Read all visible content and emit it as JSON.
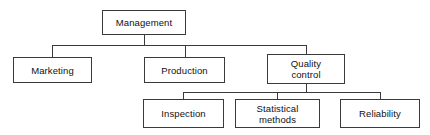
{
  "diagram": {
    "background_color": "#ffffff",
    "border_color": "#3a3a3a",
    "text_color": "#111111",
    "nodes": [
      {
        "id": "management",
        "label": "Management",
        "level": 0,
        "x": 102,
        "y": 10,
        "w": 84,
        "h": 25
      },
      {
        "id": "marketing",
        "label": "Marketing",
        "level": 1,
        "x": 13,
        "y": 57,
        "w": 79,
        "h": 26
      },
      {
        "id": "production",
        "label": "Production",
        "level": 1,
        "x": 144,
        "y": 57,
        "w": 81,
        "h": 26
      },
      {
        "id": "quality-control",
        "label": "Quality\ncontrol",
        "level": 1,
        "x": 267,
        "y": 54,
        "w": 78,
        "h": 30
      },
      {
        "id": "inspection",
        "label": "Inspection",
        "level": 2,
        "x": 143,
        "y": 99,
        "w": 81,
        "h": 29
      },
      {
        "id": "statistical-methods",
        "label": "Statistical\nmethods",
        "level": 2,
        "x": 235,
        "y": 99,
        "w": 85,
        "h": 29
      },
      {
        "id": "reliability",
        "label": "Reliability",
        "level": 2,
        "x": 340,
        "y": 99,
        "w": 80,
        "h": 29
      }
    ],
    "edges": [
      {
        "from": "management",
        "to": "marketing"
      },
      {
        "from": "management",
        "to": "production"
      },
      {
        "from": "management",
        "to": "quality-control"
      },
      {
        "from": "quality-control",
        "to": "inspection"
      },
      {
        "from": "quality-control",
        "to": "statistical-methods"
      },
      {
        "from": "quality-control",
        "to": "reliability"
      }
    ],
    "connector_paths": [
      "M 144 35 L 144 45",
      "M 52 45 L 306 45",
      "M 52 45 L 52 57",
      "M 185 45 L 185 57",
      "M 306 45 L 306 54",
      "M 306 84 L 306 92",
      "M 183 92 L 380 92",
      "M 183 92 L 183 99",
      "M 277 92 L 277 99",
      "M 380 92 L 380 99"
    ]
  }
}
